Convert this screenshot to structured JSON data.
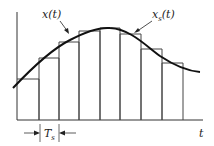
{
  "labels": {
    "signal": "x(t)",
    "sampled_main": "x",
    "sampled_sub": "s",
    "sampled_tail": "(t)",
    "period_main": "T",
    "period_sub": "s",
    "time_axis": "t"
  },
  "colors": {
    "line": "#333333",
    "curve": "#111111",
    "background": "#ffffff"
  },
  "axes": {
    "origin_x": 17,
    "baseline_y": 120,
    "y_top": 12,
    "x_end": 203
  },
  "pulses": [
    {
      "x0": 17,
      "x1": 39,
      "top": 79
    },
    {
      "x0": 39,
      "x1": 59,
      "top": 58
    },
    {
      "x0": 59,
      "x1": 79,
      "top": 42
    },
    {
      "x0": 79,
      "x1": 100,
      "top": 31
    },
    {
      "x0": 100,
      "x1": 120,
      "top": 28
    },
    {
      "x0": 120,
      "x1": 141,
      "top": 34
    },
    {
      "x0": 141,
      "x1": 162,
      "top": 49
    },
    {
      "x0": 162,
      "x1": 183,
      "top": 63
    }
  ]
}
